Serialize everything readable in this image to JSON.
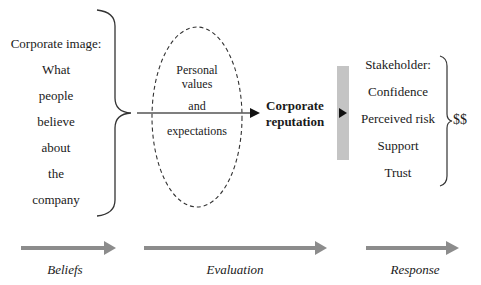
{
  "beliefs_block": {
    "lines": [
      "Corporate image:",
      "What",
      "people",
      "believe",
      "about",
      "the",
      "company"
    ]
  },
  "evaluation_ellipse": {
    "line1": "Personal",
    "line2": "values",
    "line3": "and",
    "line4": "expectations"
  },
  "reputation": {
    "line1": "Corporate",
    "line2": "reputation"
  },
  "stakeholder_block": {
    "lines": [
      "Stakeholder:",
      "Confidence",
      "Perceived risk",
      "Support",
      "Trust"
    ],
    "outcome": "$$"
  },
  "stages": [
    {
      "label": "Beliefs"
    },
    {
      "label": "Evaluation"
    },
    {
      "label": "Response"
    }
  ],
  "colors": {
    "arrow_gray": "#8c8c8c",
    "bar_gray": "#c4c4c4",
    "line": "#333333"
  }
}
